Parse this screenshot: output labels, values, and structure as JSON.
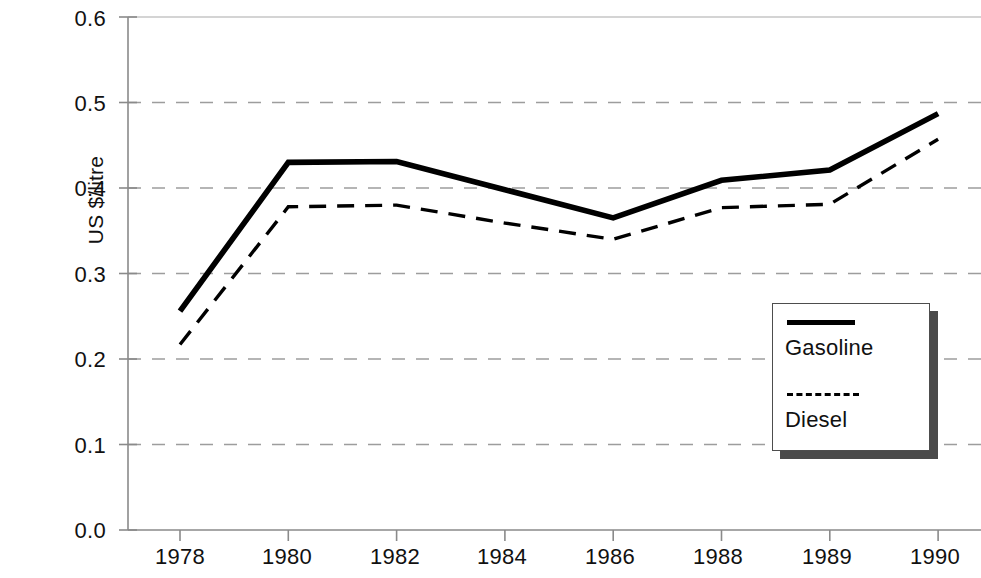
{
  "chart_data": {
    "type": "line",
    "title": "",
    "xlabel": "",
    "ylabel": "US $/litre",
    "categories": [
      "1978",
      "1980",
      "1982",
      "1984",
      "1986",
      "1988",
      "1989",
      "1990"
    ],
    "ylim": [
      0.0,
      0.6
    ],
    "ytick_labels": [
      "0.6",
      "0.5",
      "0.4",
      "0.3",
      "0.2",
      "0.1",
      "0.0"
    ],
    "ytick_values": [
      0.6,
      0.5,
      0.4,
      0.3,
      0.2,
      0.1,
      0.0
    ],
    "grid": "horizontal-dashed",
    "legend_position": "inside-right",
    "series": [
      {
        "name": "Gasoline",
        "style": "solid-thick",
        "values": [
          0.256,
          0.43,
          0.431,
          0.398,
          0.365,
          0.409,
          0.421,
          0.487
        ]
      },
      {
        "name": "Diesel",
        "style": "dashed",
        "values": [
          0.217,
          0.378,
          0.38,
          0.359,
          0.34,
          0.377,
          0.381,
          0.457
        ]
      }
    ],
    "legend": [
      {
        "label": "Gasoline",
        "style": "solid-thick"
      },
      {
        "label": "Diesel",
        "style": "dashed"
      }
    ]
  },
  "axis": {
    "y_title": "US $/litre",
    "y_labels": [
      "0.6",
      "0.5",
      "0.4",
      "0.3",
      "0.2",
      "0.1",
      "0.0"
    ],
    "x_labels": [
      "1978",
      "1980",
      "1982",
      "1984",
      "1986",
      "1988",
      "1989",
      "1990"
    ]
  },
  "legend": {
    "items": [
      {
        "label": "Gasoline"
      },
      {
        "label": "Diesel"
      }
    ]
  }
}
